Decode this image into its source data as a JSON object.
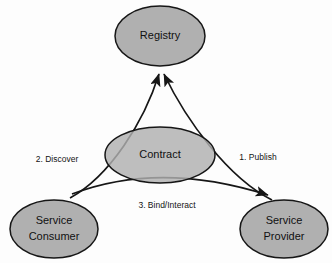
{
  "diagram": {
    "colors": {
      "node_fill": "#b0b0b0",
      "node_stroke": "#161616",
      "edge_stroke": "#161616",
      "background": "#fdfdfd",
      "label_text": "#111111"
    },
    "nodes": [
      {
        "id": "registry",
        "label": "Registry",
        "label_lines": [
          "Registry"
        ],
        "shape": "ellipse",
        "cx": 160,
        "cy": 36,
        "rx": 45,
        "ry": 30
      },
      {
        "id": "contract",
        "label": "Contract",
        "label_lines": [
          "Contract"
        ],
        "shape": "ellipse",
        "cx": 160,
        "cy": 155,
        "rx": 55,
        "ry": 28
      },
      {
        "id": "service-consumer",
        "label": "Service Consumer",
        "label_lines": [
          "Service",
          "Consumer"
        ],
        "shape": "ellipse",
        "cx": 54,
        "cy": 229,
        "rx": 44,
        "ry": 29
      },
      {
        "id": "service-provider",
        "label": "Service Provider",
        "label_lines": [
          "Service",
          "Provider"
        ],
        "shape": "ellipse",
        "cx": 284,
        "cy": 229,
        "rx": 44,
        "ry": 29
      }
    ],
    "edges": [
      {
        "id": "publish",
        "label": "1. Publish",
        "from": "service-provider",
        "to": "registry",
        "label_x": 258,
        "label_y": 158
      },
      {
        "id": "discover",
        "label": "2. Discover",
        "from": "service-consumer",
        "to": "registry",
        "label_x": 57,
        "label_y": 160
      },
      {
        "id": "bind-interact",
        "label": "3. Bind/Interact",
        "from": "service-consumer",
        "to": "service-provider",
        "label_x": 167,
        "label_y": 206
      }
    ]
  }
}
